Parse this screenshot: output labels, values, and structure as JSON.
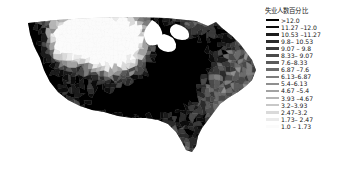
{
  "figure": {
    "kind": "choropleth-map",
    "background_color": "#ffffff",
    "region_name": "United States (contiguous)",
    "geography_level": "county"
  },
  "legend": {
    "title": "失业人数百分比",
    "position": "right",
    "entries": [
      {
        "label": ">12.0",
        "color": "#000000",
        "min": 12.0,
        "max": null
      },
      {
        "label": "11.27 –12.0",
        "color": "#0d0d0d",
        "min": 11.27,
        "max": 12.0
      },
      {
        "label": "10.53 –11.27",
        "color": "#1c1c1c",
        "min": 10.53,
        "max": 11.27
      },
      {
        "label": "9.8–  10.53",
        "color": "#2b2b2b",
        "min": 9.8,
        "max": 10.53
      },
      {
        "label": "9.07 – 9.8",
        "color": "#3b3b3b",
        "min": 9.07,
        "max": 9.8
      },
      {
        "label": "8.33– 9.07",
        "color": "#4a4a4a",
        "min": 8.33,
        "max": 9.07
      },
      {
        "label": "7.6–8.33",
        "color": "#5a5a5a",
        "min": 7.6,
        "max": 8.33
      },
      {
        "label": "6.87 –7.6",
        "color": "#6b6b6b",
        "min": 6.87,
        "max": 7.6
      },
      {
        "label": "6.13–6.87",
        "color": "#7d7d7d",
        "min": 6.13,
        "max": 6.87
      },
      {
        "label": "5.4–6.13",
        "color": "#8f8f8f",
        "min": 5.4,
        "max": 6.13
      },
      {
        "label": "4.67 –5.4",
        "color": "#a2a2a2",
        "min": 4.67,
        "max": 5.4
      },
      {
        "label": "3.93 –4.67",
        "color": "#b5b5b5",
        "min": 3.93,
        "max": 4.67
      },
      {
        "label": "3.2–3.93",
        "color": "#c8c8c8",
        "min": 3.2,
        "max": 3.93
      },
      {
        "label": "2.47–3.2",
        "color": "#dadada",
        "min": 2.47,
        "max": 3.2
      },
      {
        "label": "1.73– 2.47",
        "color": "#ebebeb",
        "min": 1.73,
        "max": 2.47
      },
      {
        "label": "1.0 – 1.73",
        "color": "#fbfbfb",
        "min": 1.0,
        "max": 1.73
      }
    ]
  },
  "chart_data": {
    "type": "heatmap",
    "title": "失业人数百分比",
    "xlabel": "",
    "ylabel": "",
    "grid": false,
    "legend_position": "right",
    "value_unit": "percent",
    "value_range": [
      1.0,
      12.0
    ],
    "class_breaks": [
      1.0,
      1.73,
      2.47,
      3.2,
      3.93,
      4.67,
      5.4,
      6.13,
      6.87,
      7.6,
      8.33,
      9.07,
      9.8,
      10.53,
      11.27,
      12.0
    ],
    "colorscale": [
      "#fbfbfb",
      "#ebebeb",
      "#dadada",
      "#c8c8c8",
      "#b5b5b5",
      "#a2a2a2",
      "#8f8f8f",
      "#7d7d7d",
      "#6b6b6b",
      "#5a5a5a",
      "#4a4a4a",
      "#3b3b3b",
      "#2b2b2b",
      "#1c1c1c",
      "#0d0d0d",
      "#000000"
    ],
    "categories": [
      ">12.0",
      "11.27 –12.0",
      "10.53 –11.27",
      "9.8–  10.53",
      "9.07 – 9.8",
      "8.33– 9.07",
      "7.6–8.33",
      "6.87 –7.6",
      "6.13–6.87",
      "5.4–6.13",
      "4.67 –5.4",
      "3.93 –4.67",
      "3.2–3.93",
      "2.47–3.2",
      "1.73– 2.47",
      "1.0 – 1.73"
    ],
    "values": [
      null,
      null,
      null,
      null,
      null,
      null,
      null,
      null,
      null,
      null,
      null,
      null,
      null,
      null,
      null,
      null
    ]
  }
}
